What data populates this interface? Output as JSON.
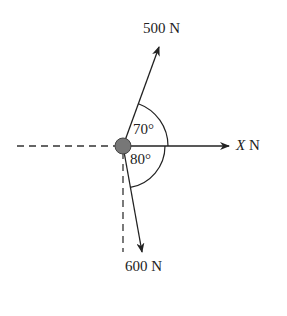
{
  "diagram": {
    "forces": [
      {
        "label": "500 N",
        "angle_from_x_deg": 70,
        "direction": "up-right"
      },
      {
        "label": "X N",
        "angle_from_x_deg": 0,
        "direction": "right"
      },
      {
        "label": "600 N",
        "angle_from_x_deg": -80,
        "direction": "down-right"
      }
    ],
    "angles": {
      "upper": "70°",
      "lower": "80°"
    },
    "labels": {
      "f500": "500 N",
      "fx_var": "X",
      "fx_unit": " N",
      "f600": "600 N"
    },
    "colors": {
      "line": "#222222",
      "node": "#777777"
    }
  }
}
